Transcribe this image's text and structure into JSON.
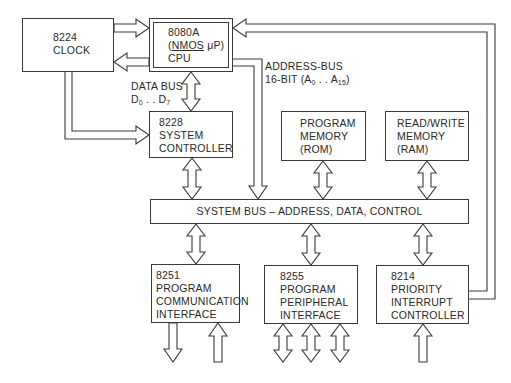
{
  "diagram": {
    "blocks": {
      "clock": {
        "lines": [
          "8224",
          "CLOCK"
        ]
      },
      "cpu": {
        "part": "8080A",
        "tech_prefix": "(",
        "tech_underlined": "NMOS",
        "tech_suffix": " μP)",
        "role": "CPU"
      },
      "system_controller": {
        "lines": [
          "8228",
          "SYSTEM",
          "CONTROLLER"
        ]
      },
      "rom": {
        "lines": [
          "PROGRAM",
          "MEMORY",
          "(ROM)"
        ]
      },
      "ram": {
        "lines": [
          "READ/WRITE",
          "MEMORY",
          "(RAM)"
        ]
      },
      "system_bus": {
        "label": "SYSTEM BUS – ADDRESS, DATA, CONTROL"
      },
      "comm_interface": {
        "lines": [
          "8251",
          "PROGRAM",
          "COMMUNICATION",
          "INTERFACE"
        ]
      },
      "peripheral_interface": {
        "lines": [
          "8255",
          "PROGRAM",
          "PERIPHERAL",
          "INTERFACE"
        ]
      },
      "interrupt_controller": {
        "lines": [
          "8214",
          "PRIORITY",
          "INTERRUPT",
          "CONTROLLER"
        ]
      }
    },
    "annotations": {
      "data_bus": {
        "line1": "DATA BUS",
        "d_prefix": "D",
        "d_from": "0",
        "dots": " . . ",
        "d_to": "7"
      },
      "address_bus": {
        "line1": "ADDRESS-BUS",
        "line2_prefix": "16-BIT (A",
        "a_from": "0",
        "dots": " . . A",
        "a_to": "15",
        "close": ")"
      }
    },
    "connections": [
      {
        "from": "clock",
        "to": "cpu",
        "type": "unidirectional"
      },
      {
        "from": "cpu",
        "to": "clock",
        "type": "unidirectional"
      },
      {
        "from": "cpu",
        "to": "system_controller",
        "type": "bidirectional",
        "label": "data_bus"
      },
      {
        "from": "clock",
        "to": "system_controller",
        "type": "unidirectional"
      },
      {
        "from": "cpu",
        "to": "system_bus",
        "type": "unidirectional",
        "label": "address_bus"
      },
      {
        "from": "system_controller",
        "to": "system_bus",
        "type": "bidirectional"
      },
      {
        "from": "rom",
        "to": "system_bus",
        "type": "bidirectional"
      },
      {
        "from": "ram",
        "to": "system_bus",
        "type": "bidirectional"
      },
      {
        "from": "system_bus",
        "to": "comm_interface",
        "type": "bidirectional"
      },
      {
        "from": "system_bus",
        "to": "peripheral_interface",
        "type": "bidirectional"
      },
      {
        "from": "system_bus",
        "to": "interrupt_controller",
        "type": "bidirectional"
      },
      {
        "from": "interrupt_controller",
        "to": "cpu",
        "type": "unidirectional"
      },
      {
        "from": "comm_interface",
        "to": "external",
        "type": "output"
      },
      {
        "from": "external",
        "to": "comm_interface",
        "type": "input"
      },
      {
        "from": "peripheral_interface",
        "to": "external",
        "type": "bidirectional",
        "count": 3
      },
      {
        "from": "external",
        "to": "interrupt_controller",
        "type": "input"
      }
    ],
    "colors": {
      "line": "#3a3a3a",
      "background": "#ffffff"
    }
  }
}
